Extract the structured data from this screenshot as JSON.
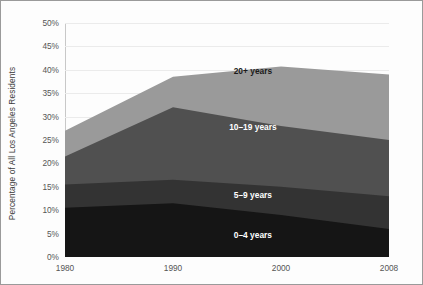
{
  "chart_data": {
    "type": "area",
    "stacked": true,
    "title": "",
    "subtitle": "",
    "xlabel": "",
    "ylabel": "Percentage of All Los Angeles Residents",
    "x": [
      1980,
      1990,
      2000,
      2008
    ],
    "categories": [
      "1980",
      "1990",
      "2000",
      "2008"
    ],
    "xtick_labels": [
      "1980",
      "1990",
      "2000",
      "2008"
    ],
    "ytick_labels": [
      "0%",
      "5%",
      "10%",
      "15%",
      "20%",
      "25%",
      "30%",
      "35%",
      "40%",
      "45%",
      "50%"
    ],
    "ytick_values": [
      0,
      5,
      10,
      15,
      20,
      25,
      30,
      35,
      40,
      45,
      50
    ],
    "ylim": [
      0,
      50
    ],
    "xlim": [
      1980,
      2008
    ],
    "grid": true,
    "grid_axis": "y",
    "legend_position": "inline-annotations",
    "series": [
      {
        "name": "0-4 years",
        "label": "0–4 years",
        "color": "#151515",
        "label_color": "light",
        "values": [
          10.5,
          11.5,
          9.0,
          6.0
        ]
      },
      {
        "name": "5-9 years",
        "label": "5–9 years",
        "color": "#333333",
        "label_color": "light",
        "values": [
          5.0,
          5.0,
          6.0,
          7.0
        ]
      },
      {
        "name": "10-19 years",
        "label": "10–19 years",
        "color": "#505050",
        "label_color": "light",
        "values": [
          6.0,
          15.5,
          13.0,
          12.0
        ]
      },
      {
        "name": "20+ years",
        "label": "20+ years",
        "color": "#9a9a9a",
        "label_color": "dark",
        "values": [
          5.5,
          6.5,
          12.7,
          14.0
        ]
      }
    ],
    "cumulative_tops": [
      [
        10.5,
        11.5,
        9.0,
        6.0
      ],
      [
        15.5,
        16.5,
        15.0,
        13.0
      ],
      [
        21.5,
        32.0,
        28.0,
        25.0
      ],
      [
        27.0,
        38.5,
        40.7,
        39.0
      ]
    ],
    "annotations": [
      {
        "text": "20+ years",
        "x_frac": 0.58,
        "y_frac": 0.205,
        "color": "dark"
      },
      {
        "text": "10–19 years",
        "x_frac": 0.58,
        "y_frac": 0.445,
        "color": "light"
      },
      {
        "text": "5–9 years",
        "x_frac": 0.58,
        "y_frac": 0.735,
        "color": "light"
      },
      {
        "text": "0–4 years",
        "x_frac": 0.58,
        "y_frac": 0.905,
        "color": "light"
      }
    ],
    "colors": {
      "background": "#fdfdfd",
      "frame_border": "#9a9a9a",
      "gridline": "#ebebeb",
      "axis_line": "#9e9e9e",
      "tick_text": "#555555",
      "title_text": "#3a3a3a"
    }
  }
}
